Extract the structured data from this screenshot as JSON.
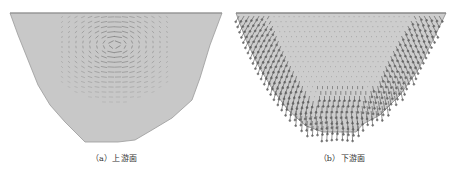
{
  "figure": {
    "panels": [
      {
        "id": "a",
        "caption": "（a）上游面",
        "description": "Vector field on upstream face of dam cross-section",
        "fill_color": "#c8c8c8",
        "edge_color": "#9a9a9a",
        "arrow_color": "#6e6e6e"
      },
      {
        "id": "b",
        "caption": "（b）下游面",
        "description": "Vector field on downstream face of dam cross-section",
        "fill_color": "#cdcdcd",
        "edge_color": "#8a8a8a",
        "arrow_color": "#5a5a5a"
      }
    ]
  }
}
